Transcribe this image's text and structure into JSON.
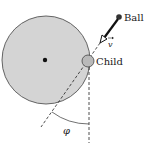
{
  "diagram": {
    "labels": {
      "ball": "Ball",
      "child": "Child",
      "velocity": "v",
      "angle": "φ"
    },
    "colors": {
      "merry_go_round_fill": "#d4d4d4",
      "merry_go_round_stroke": "#555555",
      "child_fill": "#b9b9b9",
      "ink": "#1a1a1a",
      "background": "#ffffff"
    }
  }
}
